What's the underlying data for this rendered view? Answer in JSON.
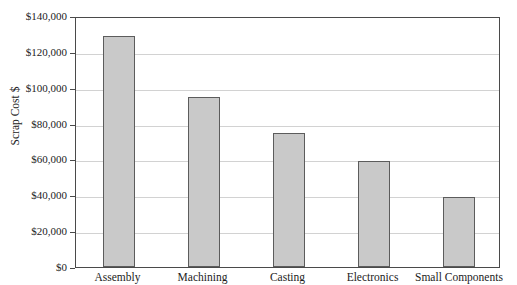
{
  "chart_data": {
    "type": "bar",
    "title": "",
    "xlabel": "",
    "ylabel": "Scrap Cost $",
    "categories": [
      "Assembly",
      "Machining",
      "Casting",
      "Electronics",
      "Small Components"
    ],
    "values": [
      129000,
      95000,
      75000,
      59000,
      39000
    ],
    "ylim": [
      0,
      140000
    ],
    "ytick_values": [
      140000,
      120000,
      100000,
      80000,
      60000,
      40000,
      20000,
      0
    ],
    "ytick_labels": [
      "$140,000",
      "$120,000",
      "$100,000",
      "$80,000",
      "$60,000",
      "$40,000",
      "$20,000",
      "$0"
    ],
    "grid": "horizontal",
    "legend": "none",
    "bar_color": "#c9c9c9",
    "bar_border_color": "#5c5c5c",
    "gridline_color": "#d2d2d2",
    "axis_color": "#4a4a4a",
    "text_color": "#1c1c1c"
  }
}
